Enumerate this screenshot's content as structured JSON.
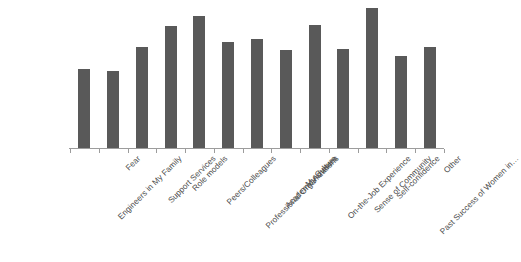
{
  "chart_data": {
    "type": "bar",
    "title": "",
    "subtitle": "",
    "xlabel": "",
    "ylabel": "",
    "grid": false,
    "legend": null,
    "axis": {
      "y_axis_visible": false,
      "x_axis_visible": true,
      "tick_labels_visible": false,
      "ylim": [
        0,
        100
      ]
    },
    "bar_color": "#595959",
    "label_color": "#4a4a4a",
    "axis_color": "#9c9c9c",
    "categories": [
      "Engineers in My Family",
      "Fear",
      "Support Services",
      "Role models",
      "Peers/Colleagues",
      "Professional Organizations",
      "Academic Advisers",
      "My Culture",
      "On-the-Job Experience",
      "Sense of Community",
      "Self-confidence",
      "Past Success of Women in…",
      "Other"
    ],
    "values": [
      57,
      55,
      72,
      87,
      94,
      76,
      78,
      70,
      88,
      71,
      100,
      66,
      72
    ]
  }
}
